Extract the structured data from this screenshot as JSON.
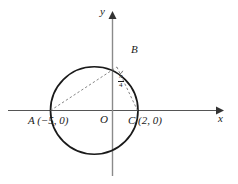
{
  "figure": {
    "type": "geometry-diagram",
    "axes": {
      "x_label": "x",
      "y_label": "y",
      "origin_label": "O"
    },
    "points": [
      {
        "id": "A",
        "label": "A",
        "coords_text": "(−5, 0)",
        "full_label": "A (−5, 0)",
        "x": -5,
        "y": 0
      },
      {
        "id": "B",
        "label": "B",
        "coords_text": "",
        "full_label": "B",
        "x": 0.35,
        "y": 3.48
      },
      {
        "id": "C",
        "label": "C",
        "coords_text": "(2, 0)",
        "full_label": "C (2, 0)",
        "x": 2,
        "y": 0
      },
      {
        "id": "O",
        "label": "O",
        "coords_text": "",
        "full_label": "O",
        "x": 0,
        "y": 0
      }
    ],
    "angle": {
      "vertex": "B",
      "numerator": "π",
      "denominator": "4",
      "value_text": "π/4"
    },
    "circle": {
      "center_x": -1.5,
      "center_y": 0,
      "radius": 3.5
    },
    "segments": [
      {
        "from": "A",
        "to": "B",
        "style": "dashed"
      },
      {
        "from": "B",
        "to": "C",
        "style": "dashed"
      }
    ],
    "colors": {
      "stroke": "#1a1a1a",
      "axis": "#555555",
      "dashed": "#6a6a6a",
      "background": "#ffffff"
    }
  }
}
